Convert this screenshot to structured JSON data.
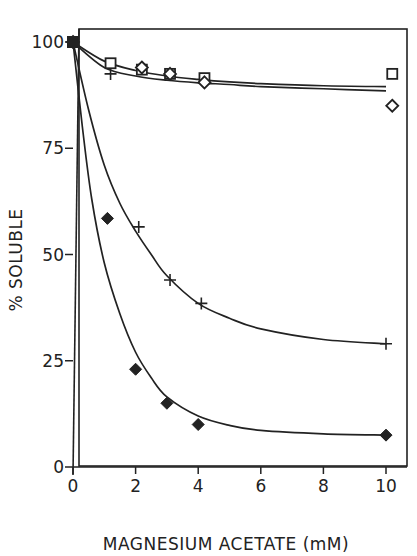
{
  "chart_data": {
    "type": "scatter",
    "title": "",
    "xlabel": "MAGNESIUM ACETATE (mM)",
    "ylabel": "% SOLUBLE",
    "xlim": [
      0,
      10
    ],
    "ylim": [
      0,
      100
    ],
    "x_ticks": [
      0,
      2,
      4,
      6,
      8,
      10
    ],
    "y_ticks": [
      0,
      25,
      50,
      75,
      100
    ],
    "grid": false,
    "legend": null,
    "series": [
      {
        "name": "open-square",
        "marker": "square-open",
        "points": [
          [
            0,
            100
          ],
          [
            1.2,
            95
          ],
          [
            2.2,
            93.5
          ],
          [
            3.1,
            92.5
          ],
          [
            4.2,
            91.5
          ],
          [
            10.2,
            92.5
          ]
        ],
        "fit_curve": [
          [
            0,
            100
          ],
          [
            1,
            95.5
          ],
          [
            2,
            93.3
          ],
          [
            3,
            92
          ],
          [
            4,
            91.2
          ],
          [
            5,
            90.6
          ],
          [
            6,
            90.2
          ],
          [
            8,
            89.7
          ],
          [
            10,
            89.5
          ]
        ]
      },
      {
        "name": "open-diamond",
        "marker": "diamond-open",
        "points": [
          [
            0,
            100
          ],
          [
            2.2,
            94
          ],
          [
            3.1,
            92.5
          ],
          [
            4.2,
            90.5
          ],
          [
            10.2,
            85
          ]
        ],
        "fit_curve": [
          [
            0,
            100
          ],
          [
            1,
            94
          ],
          [
            2,
            92
          ],
          [
            3,
            91
          ],
          [
            4,
            90.4
          ],
          [
            5,
            90
          ],
          [
            6,
            89.5
          ],
          [
            8,
            89
          ],
          [
            10,
            88.5
          ]
        ]
      },
      {
        "name": "plus",
        "marker": "plus",
        "points": [
          [
            0,
            100
          ],
          [
            1.2,
            92.5
          ],
          [
            2.1,
            56.5
          ],
          [
            3.1,
            44
          ],
          [
            4.1,
            38.5
          ],
          [
            10,
            29
          ]
        ],
        "fit_curve": [
          [
            0,
            100
          ],
          [
            0.5,
            84
          ],
          [
            1,
            71
          ],
          [
            1.5,
            62
          ],
          [
            2,
            55.5
          ],
          [
            2.5,
            50
          ],
          [
            3,
            45
          ],
          [
            4,
            38.5
          ],
          [
            5,
            35
          ],
          [
            6,
            32.5
          ],
          [
            8,
            30
          ],
          [
            10,
            29
          ]
        ]
      },
      {
        "name": "filled-diamond",
        "marker": "diamond-filled",
        "points": [
          [
            0,
            100
          ],
          [
            1.1,
            58.5
          ],
          [
            2.0,
            23
          ],
          [
            3.0,
            15
          ],
          [
            4.0,
            10
          ],
          [
            10,
            7.5
          ]
        ],
        "fit_curve": [
          [
            0,
            100
          ],
          [
            0.3,
            80
          ],
          [
            0.6,
            63
          ],
          [
            1,
            48
          ],
          [
            1.5,
            36
          ],
          [
            2,
            27
          ],
          [
            2.5,
            21
          ],
          [
            3,
            16.5
          ],
          [
            4,
            12
          ],
          [
            5,
            9.8
          ],
          [
            6,
            8.6
          ],
          [
            8,
            7.8
          ],
          [
            10,
            7.5
          ]
        ]
      }
    ]
  },
  "labels": {
    "x_axis_title": "MAGNESIUM ACETATE (mM)",
    "y_axis_title": "% SOLUBLE",
    "x_ticks": [
      "0",
      "2",
      "4",
      "6",
      "8",
      "10"
    ],
    "y_ticks": [
      "0",
      "25",
      "50",
      "75",
      "100"
    ]
  },
  "colors": {
    "ink": "#222222",
    "background": "#ffffff"
  }
}
